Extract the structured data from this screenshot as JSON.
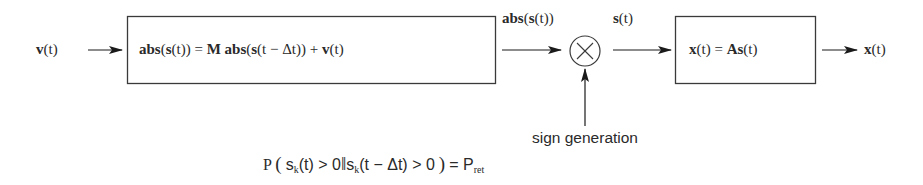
{
  "diagram": {
    "type": "block-diagram",
    "colors": {
      "stroke": "#3a3a3a",
      "text": "#2a2a2a",
      "background": "#ffffff"
    },
    "input_signal": {
      "label": "v(t)"
    },
    "blocks": [
      {
        "id": "recurrence",
        "label": "abs(s(t)) = M abs(s(t − Δt)) + v(t)"
      },
      {
        "id": "mixing",
        "label": "x(t) = As(t)"
      }
    ],
    "multiplier": {
      "symbol": "⊗"
    },
    "edges": [
      {
        "from": "input",
        "to": "recurrence",
        "label": ""
      },
      {
        "from": "recurrence",
        "to": "multiplier",
        "label": "abs(s(t))"
      },
      {
        "from": "multiplier",
        "to": "mixing",
        "label": "s(t)"
      },
      {
        "from": "sign_generation",
        "to": "multiplier",
        "label": ""
      },
      {
        "from": "mixing",
        "to": "output",
        "label": ""
      }
    ],
    "sign_generation": {
      "label": "sign generation",
      "condition": {
        "prefix": "P",
        "open": "(",
        "s1": "s",
        "k1": "k",
        "t1": "(t) > 0",
        "bar": "‖",
        "s2": "s",
        "k2": "k",
        "t2": "(t − Δt) > 0",
        "close": ")",
        "eq": "= P",
        "ret": "ret"
      }
    },
    "output_signal": {
      "label": "x(t)"
    }
  },
  "labels": {
    "v_in": {
      "bold": "v",
      "rest": "(t)"
    },
    "block1": {
      "p1": "abs",
      "p2": "(",
      "p3": "s",
      "p4": "(t)) = ",
      "p5": "M abs",
      "p6": "(",
      "p7": "s",
      "p8": "(t − Δt)) + ",
      "p9": "v",
      "p10": "(t)"
    },
    "abs_s": {
      "bold1": "abs",
      "mid": "(",
      "bold2": "s",
      "rest": "(t))"
    },
    "s_t": {
      "bold": "s",
      "rest": "(t)"
    },
    "block2": {
      "b1": "x",
      "r1": "(t) = ",
      "b2": "As",
      "r2": "(t)"
    },
    "x_out": {
      "bold": "x",
      "rest": "(t)"
    }
  }
}
